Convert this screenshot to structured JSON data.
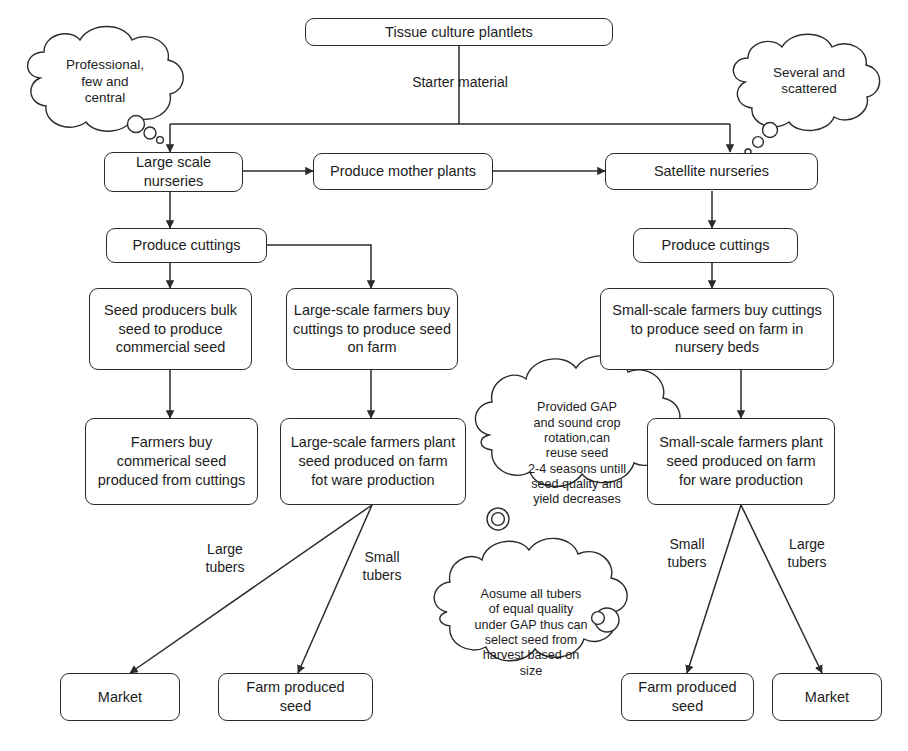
{
  "diagram": {
    "style": {
      "line_color": "#2b2b2b",
      "box_fill": "#ffffff",
      "text_color": "#1c1c1c"
    },
    "nodes": [
      {
        "id": "tissue_culture",
        "label": "Tissue culture plantlets"
      },
      {
        "id": "large_scale_nurseries",
        "label": "Large scale\nnurseries"
      },
      {
        "id": "produce_mother_plants",
        "label": "Produce mother plants"
      },
      {
        "id": "satellite_nurseries",
        "label": "Satellite nurseries"
      },
      {
        "id": "produce_cuttings_left",
        "label": "Produce cuttings"
      },
      {
        "id": "produce_cuttings_right",
        "label": "Produce cuttings"
      },
      {
        "id": "seed_producers_bulk",
        "label": "Seed producers bulk\nseed to produce\ncommercial seed"
      },
      {
        "id": "large_scale_buy",
        "label": "Large-scale farmers buy\ncuttings to produce seed\non farm"
      },
      {
        "id": "small_scale_buy",
        "label": "Small-scale farmers buy cuttings\nto produce seed on farm in\nnursery beds"
      },
      {
        "id": "farmers_buy_commercial",
        "label": "Farmers buy\ncommerical seed\nproduced from cuttings"
      },
      {
        "id": "large_scale_plant",
        "label": "Large-scale farmers plant\nseed produced on farm\nfot ware production"
      },
      {
        "id": "small_scale_plant",
        "label": "Small-scale farmers plant\nseed produced on farm\nfor ware production"
      },
      {
        "id": "market_left",
        "label": "Market"
      },
      {
        "id": "farm_produced_seed_left",
        "label": "Farm produced\nseed"
      },
      {
        "id": "farm_produced_seed_right",
        "label": "Farm produced\nseed"
      },
      {
        "id": "market_right",
        "label": "Market"
      }
    ],
    "edge_labels": [
      {
        "id": "starter_material",
        "text": "Starter material"
      },
      {
        "id": "left_large_tubers",
        "text": "Large\ntubers"
      },
      {
        "id": "left_small_tubers",
        "text": "Small\ntubers"
      },
      {
        "id": "right_small_tubers",
        "text": "Small\ntubers"
      },
      {
        "id": "right_large_tubers",
        "text": "Large\ntubers"
      }
    ],
    "clouds": [
      {
        "id": "professional_few_central",
        "text": "Professional,\nfew and\ncentral"
      },
      {
        "id": "several_scattered",
        "text": "Several and\nscattered"
      },
      {
        "id": "provided_gap",
        "text": "Provided GAP\nand sound crop\nrotation,can\nreuse seed\n2-4 seasons untill\nseed quality and\nyield decreases"
      },
      {
        "id": "assume_all_tubers",
        "text": "Aosume all tubers\nof equal quality\nunder GAP thus can\nselect seed from\nharvest based on\nsize"
      }
    ]
  }
}
